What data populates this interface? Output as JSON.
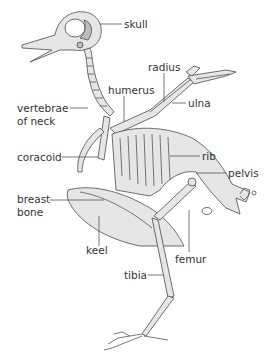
{
  "diagram": {
    "colors": {
      "bone_fill": "#e6e6e6",
      "bone_shade": "#bdbdbd",
      "outline": "#4a4a4a",
      "text": "#333333",
      "background": "#ffffff"
    },
    "labels": [
      {
        "id": "skull",
        "text": "skull"
      },
      {
        "id": "radius",
        "text": "radius"
      },
      {
        "id": "vertebrae",
        "text": "vertebrae"
      },
      {
        "id": "of_neck",
        "text": "of neck"
      },
      {
        "id": "humerus",
        "text": "humerus"
      },
      {
        "id": "ulna",
        "text": "ulna"
      },
      {
        "id": "coracoid",
        "text": "coracoid"
      },
      {
        "id": "rib",
        "text": "rib"
      },
      {
        "id": "pelvis",
        "text": "pelvis"
      },
      {
        "id": "breast",
        "text": "breast"
      },
      {
        "id": "bone",
        "text": "bone"
      },
      {
        "id": "keel",
        "text": "keel"
      },
      {
        "id": "femur",
        "text": "femur"
      },
      {
        "id": "tibia",
        "text": "tibia"
      }
    ]
  }
}
